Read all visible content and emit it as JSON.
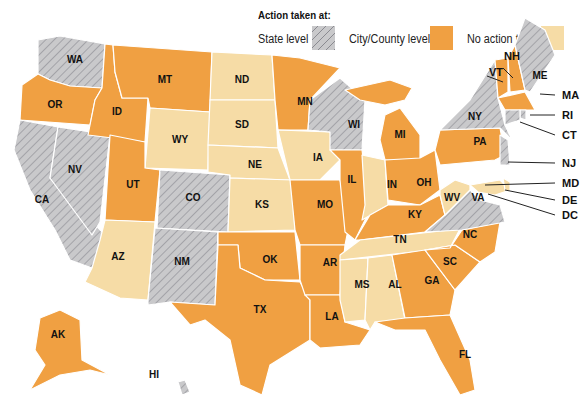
{
  "legend": {
    "title": "Action taken at:",
    "items": [
      {
        "key": "state",
        "label": "State level"
      },
      {
        "key": "city",
        "label": "City/County level"
      },
      {
        "key": "none",
        "label": "No action taken"
      }
    ]
  },
  "colors": {
    "state": "#c9c9cb",
    "state_stripe": "#8a8a90",
    "city": "#f0a042",
    "none": "#f6dca6"
  },
  "states": {
    "WA": "state",
    "OR": "city",
    "CA": "state",
    "NV": "state",
    "ID": "city",
    "MT": "city",
    "WY": "none",
    "UT": "city",
    "AZ": "none",
    "CO": "state",
    "NM": "state",
    "ND": "none",
    "SD": "none",
    "NE": "none",
    "KS": "none",
    "OK": "city",
    "TX": "city",
    "MN": "city",
    "IA": "none",
    "MO": "city",
    "AR": "city",
    "LA": "city",
    "WI": "state",
    "IL": "city",
    "MI": "city",
    "IN": "none",
    "OH": "city",
    "KY": "city",
    "TN": "none",
    "MS": "none",
    "AL": "none",
    "GA": "city",
    "FL": "city",
    "SC": "city",
    "NC": "city",
    "VA": "state",
    "WV": "none",
    "PA": "city",
    "NY": "state",
    "VT": "city",
    "NH": "city",
    "ME": "state",
    "MA": "city",
    "RI": "state",
    "CT": "state",
    "NJ": "state",
    "MD": "none",
    "DE": "none",
    "DC": "none",
    "AK": "city",
    "HI": "state"
  },
  "callouts": [
    "VT",
    "NH",
    "ME",
    "MA",
    "RI",
    "CT",
    "NJ",
    "MD",
    "DE",
    "DC"
  ]
}
